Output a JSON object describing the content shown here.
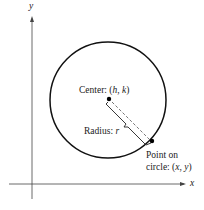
{
  "diagram": {
    "axes": {
      "x_label": "x",
      "y_label": "y"
    },
    "circle": {
      "cx": 108,
      "cy": 100,
      "r": 58
    },
    "center": {
      "label_prefix": "Center: (",
      "h": "h",
      "sep": ", ",
      "k": "k",
      "label_suffix": ")"
    },
    "radius": {
      "label_prefix": "Radius: ",
      "r": "r"
    },
    "point": {
      "line1": "Point on",
      "line2_prefix": "circle: (",
      "x": "x",
      "sep": ", ",
      "y": "y",
      "line2_suffix": ")"
    }
  }
}
